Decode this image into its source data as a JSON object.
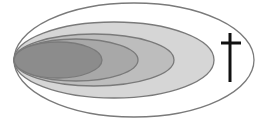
{
  "diagram": {
    "background": "#ffffff",
    "stroke_color": "#7a7a7a",
    "ellipses": [
      {
        "name": "outer-ellipse",
        "cx": 134,
        "cy": 60,
        "rx": 120,
        "ry": 57,
        "fill": "#ffffff"
      },
      {
        "name": "level-1-ellipse",
        "cx": 114,
        "cy": 60,
        "rx": 100,
        "ry": 38,
        "fill": "#d6d6d6"
      },
      {
        "name": "level-2-ellipse",
        "cx": 94,
        "cy": 60,
        "rx": 80,
        "ry": 26,
        "fill": "#bdbdbd"
      },
      {
        "name": "level-3-ellipse",
        "cx": 76,
        "cy": 60,
        "rx": 62,
        "ry": 21,
        "fill": "#a8a8a8"
      },
      {
        "name": "level-4-ellipse",
        "cx": 58,
        "cy": 60,
        "rx": 44,
        "ry": 18,
        "fill": "#8c8c8c"
      }
    ],
    "cross": {
      "color": "#111111",
      "vertical": {
        "x": 230,
        "y1": 33,
        "y2": 82
      },
      "horizontal": {
        "y": 43,
        "x1": 221,
        "x2": 241
      }
    }
  }
}
